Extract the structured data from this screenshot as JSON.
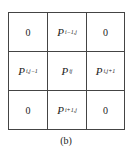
{
  "grid": {
    "cells": [
      [
        {
          "main": "0",
          "sub": ""
        },
        {
          "main": "P",
          "sub": "i−1,j"
        },
        {
          "main": "0",
          "sub": ""
        }
      ],
      [
        {
          "main": "P",
          "sub": "i,j−1"
        },
        {
          "main": "P",
          "sub": "ij"
        },
        {
          "main": "P",
          "sub": "i,j+1"
        }
      ],
      [
        {
          "main": "0",
          "sub": ""
        },
        {
          "main": "P",
          "sub": "i+1,j"
        },
        {
          "main": "0",
          "sub": ""
        }
      ]
    ]
  },
  "caption": "(b)"
}
